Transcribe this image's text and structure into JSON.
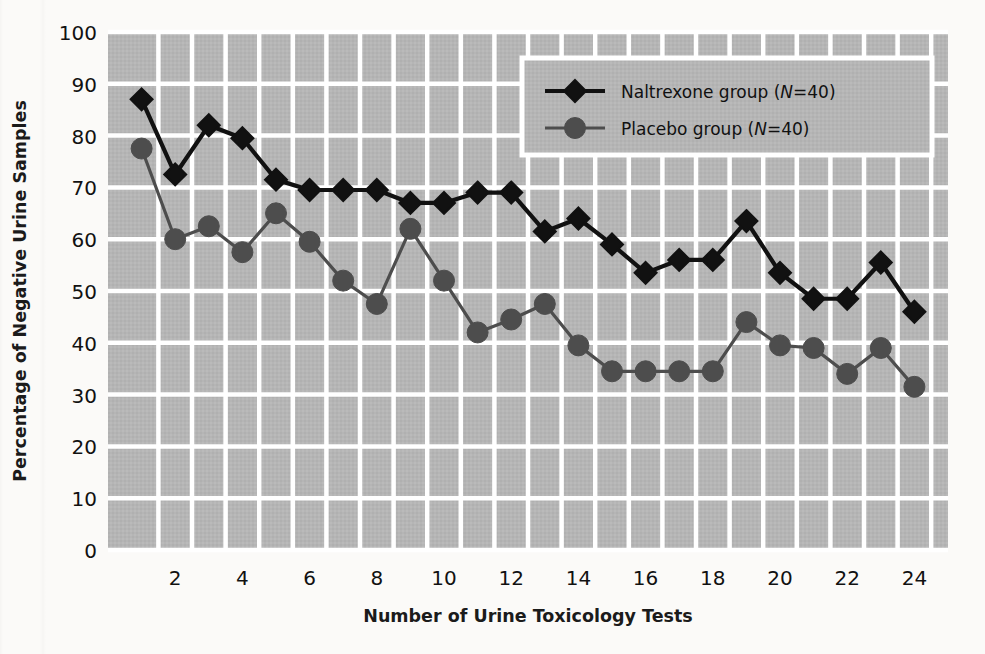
{
  "chart_data": {
    "type": "line",
    "title": "",
    "xlabel": "Number of Urine Toxicology Tests",
    "ylabel": "Percentage of Negative Urine Samples",
    "xlim": [
      0,
      25
    ],
    "ylim": [
      0,
      100
    ],
    "xticks": [
      2,
      4,
      6,
      8,
      10,
      12,
      14,
      16,
      18,
      20,
      22,
      24
    ],
    "yticks": [
      0,
      10,
      20,
      30,
      40,
      50,
      60,
      70,
      80,
      90,
      100
    ],
    "grid": true,
    "legend_position": "upper-right",
    "x": [
      1,
      2,
      3,
      4,
      5,
      6,
      7,
      8,
      9,
      10,
      11,
      12,
      13,
      14,
      15,
      16,
      17,
      18,
      19,
      20,
      21,
      22,
      23,
      24
    ],
    "series": [
      {
        "name": "Naltrexone group (N=40)",
        "marker": "diamond",
        "color": "#111111",
        "values": [
          87,
          72.5,
          82,
          79.5,
          71.5,
          69.5,
          69.5,
          69.5,
          67,
          67,
          69,
          69,
          61.5,
          64,
          59,
          53.5,
          56,
          56,
          63.5,
          53.5,
          48.5,
          48.5,
          55.5,
          46
        ]
      },
      {
        "name": "Placebo group (N=40)",
        "marker": "circle",
        "color": "#4d4d4d",
        "values": [
          77.5,
          60,
          62.5,
          57.5,
          65,
          59.5,
          52,
          47.5,
          62,
          52,
          42,
          44.5,
          47.5,
          39.5,
          34.5,
          34.5,
          34.5,
          34.5,
          44,
          39.5,
          39,
          34,
          39,
          31.5
        ]
      }
    ],
    "plot_background": "#b5b5b5",
    "gridline_color": "#ffffff",
    "legend_background": "#b5b5b5",
    "legend_border": "#ffffff"
  },
  "legend": {
    "items": [
      {
        "label_main": "Naltrexone group (",
        "label_ital": "N",
        "label_tail": "=40)"
      },
      {
        "label_main": "Placebo group (",
        "label_ital": "N",
        "label_tail": "=40)"
      }
    ]
  },
  "axes": {
    "x_title": "Number of Urine Toxicology Tests",
    "y_title": "Percentage of Negative Urine Samples"
  }
}
